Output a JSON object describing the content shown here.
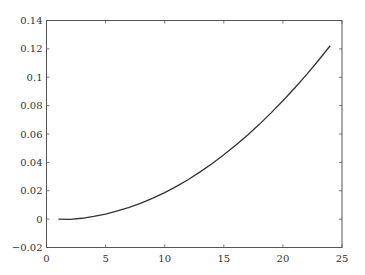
{
  "chart_data": {
    "type": "line",
    "title": "",
    "xlabel": "",
    "ylabel": "",
    "xlim": [
      0,
      25
    ],
    "ylim": [
      -0.02,
      0.14
    ],
    "grid": false,
    "legend": null,
    "x_ticks": [
      0,
      5,
      10,
      15,
      20,
      25
    ],
    "x_tick_labels": [
      "0",
      "5",
      "10",
      "15",
      "20",
      "25"
    ],
    "y_ticks": [
      -0.02,
      0,
      0.02,
      0.04,
      0.06,
      0.08,
      0.1,
      0.12,
      0.14
    ],
    "y_tick_labels": [
      "−0.02",
      "0",
      "0.02",
      "0.04",
      "0.06",
      "0.08",
      "0.1",
      "0.12",
      "0.14"
    ],
    "series": [
      {
        "name": "curve",
        "color": "#333333",
        "x": [
          1,
          2,
          3,
          4,
          5,
          6,
          7,
          8,
          9,
          10,
          11,
          12,
          13,
          14,
          15,
          16,
          17,
          18,
          19,
          20,
          21,
          22,
          23,
          24
        ],
        "y": [
          0.0,
          -0.0002,
          0.0006,
          0.0019,
          0.0036,
          0.0058,
          0.0083,
          0.0113,
          0.0148,
          0.0187,
          0.0231,
          0.0279,
          0.0333,
          0.039,
          0.0453,
          0.052,
          0.0591,
          0.0668,
          0.0749,
          0.0834,
          0.0924,
          0.1018,
          0.1118,
          0.1222
        ]
      }
    ]
  }
}
